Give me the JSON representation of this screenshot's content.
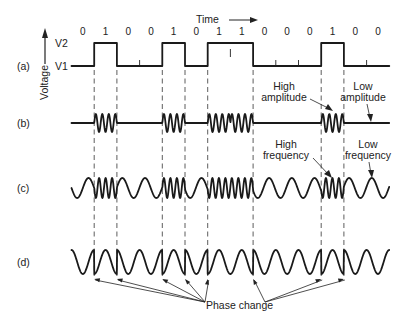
{
  "figure": {
    "time_label": "Time",
    "voltage_label": "Voltage",
    "levels": {
      "high": "V2",
      "low": "V1"
    },
    "bits": [
      "0",
      "1",
      "0",
      "0",
      "1",
      "0",
      "1",
      "1",
      "0",
      "0",
      "0",
      "1",
      "0",
      "0"
    ],
    "panels": [
      {
        "id": "a",
        "label": "(a)",
        "description": "Digital signal"
      },
      {
        "id": "b",
        "label": "(b)",
        "description": "Amplitude modulation"
      },
      {
        "id": "c",
        "label": "(c)",
        "description": "Frequency modulation"
      },
      {
        "id": "d",
        "label": "(d)",
        "description": "Phase modulation"
      }
    ],
    "annotations": {
      "high_amplitude": [
        "High",
        "amplitude"
      ],
      "low_amplitude": [
        "Low",
        "amplitude"
      ],
      "high_frequency": [
        "High",
        "frequency"
      ],
      "low_frequency": [
        "Low",
        "frequency"
      ],
      "phase_change": "Phase change"
    }
  },
  "colors": {
    "ink": "#1a1a1a",
    "background": "#ffffff"
  }
}
